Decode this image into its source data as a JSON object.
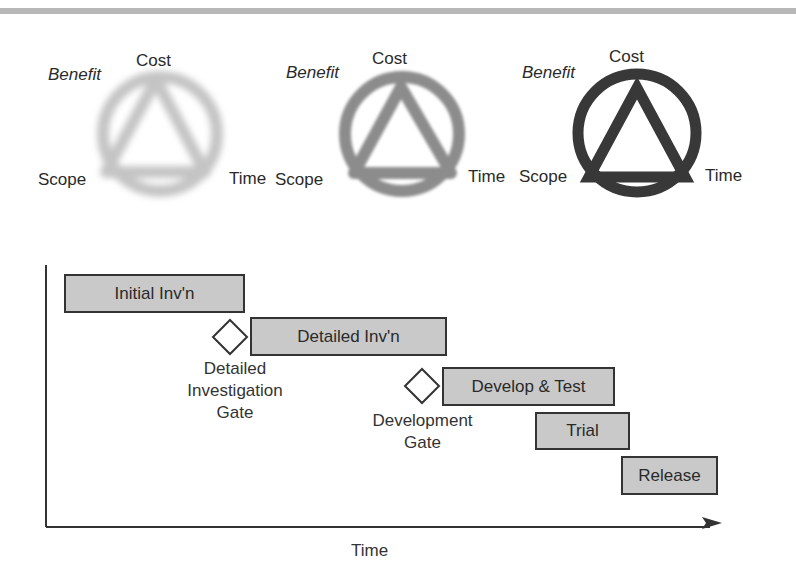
{
  "triangles": [
    {
      "id": "blurred-light",
      "labels": {
        "top": "Cost",
        "benefit": "Benefit",
        "left": "Scope",
        "right": "Time"
      },
      "color": "#c4c4c4",
      "blur": 3
    },
    {
      "id": "blurred-medium",
      "labels": {
        "top": "Cost",
        "benefit": "Benefit",
        "left": "Scope",
        "right": "Time"
      },
      "color": "#8c8c8c",
      "blur": 1.6
    },
    {
      "id": "sharp-dark",
      "labels": {
        "top": "Cost",
        "benefit": "Benefit",
        "left": "Scope",
        "right": "Time"
      },
      "color": "#383838",
      "blur": 0
    }
  ],
  "timeline": {
    "x_axis_label": "Time",
    "phases": [
      {
        "label": "Initial Inv'n"
      },
      {
        "label": "Detailed Inv'n"
      },
      {
        "label": "Develop & Test"
      },
      {
        "label": "Trial"
      },
      {
        "label": "Release"
      }
    ],
    "gates": [
      {
        "label_lines": [
          "Detailed",
          "Investigation",
          "Gate"
        ]
      },
      {
        "label_lines": [
          "Development",
          "Gate"
        ]
      }
    ]
  },
  "colors": {
    "bar_fill": "#c9c9c9",
    "bar_border": "#333333",
    "axis": "#333333",
    "top_band": "#b8b8b8"
  }
}
